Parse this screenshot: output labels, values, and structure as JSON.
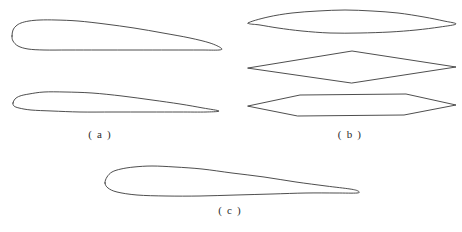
{
  "figure": {
    "background_color": "#ffffff",
    "stroke_color": "#3a3a3a",
    "stroke_width": 0.9,
    "width": 462,
    "height": 232,
    "labels": {
      "a": "( a )",
      "b": "( b )",
      "c": "( c )"
    }
  },
  "chart_data": {
    "type": "line",
    "title": "",
    "subtitle": "",
    "xlabel": "",
    "ylabel": "",
    "grid": false,
    "legend_position": "none",
    "groups": [
      {
        "key": "a",
        "label": "( a )",
        "label_x": 100,
        "label_y": 134,
        "shapes": [
          {
            "name": "thick-subsonic-airfoil",
            "kind": "rounded-airfoil",
            "chord_x0": 12,
            "chord_x1": 221,
            "leading_edge_y": 36,
            "trailing_edge_y": 50,
            "max_thickness": 30,
            "max_thickness_x_fraction": 0.14,
            "outline": [
              [
                12,
                36
              ],
              [
                13,
                30
              ],
              [
                16,
                26
              ],
              [
                21,
                23
              ],
              [
                29,
                21
              ],
              [
                40,
                20
              ],
              [
                56,
                20
              ],
              [
                78,
                21
              ],
              [
                105,
                24
              ],
              [
                134,
                28
              ],
              [
                163,
                33
              ],
              [
                190,
                38
              ],
              [
                210,
                43
              ],
              [
                221,
                48
              ],
              [
                219,
                50
              ],
              [
                200,
                50
              ],
              [
                170,
                50
              ],
              [
                135,
                50
              ],
              [
                100,
                50
              ],
              [
                68,
                50
              ],
              [
                44,
                50
              ],
              [
                28,
                49
              ],
              [
                18,
                46
              ],
              [
                13,
                41
              ],
              [
                12,
                36
              ]
            ]
          },
          {
            "name": "thin-subsonic-airfoil",
            "kind": "rounded-airfoil",
            "chord_x0": 13,
            "chord_x1": 219,
            "leading_edge_y": 103,
            "trailing_edge_y": 111,
            "max_thickness": 20,
            "max_thickness_x_fraction": 0.17,
            "outline": [
              [
                13,
                103
              ],
              [
                15,
                99
              ],
              [
                20,
                96
              ],
              [
                29,
                94
              ],
              [
                44,
                92
              ],
              [
                65,
                92
              ],
              [
                92,
                93
              ],
              [
                122,
                96
              ],
              [
                152,
                100
              ],
              [
                180,
                104
              ],
              [
                203,
                108
              ],
              [
                219,
                111
              ],
              [
                206,
                112
              ],
              [
                180,
                112
              ],
              [
                148,
                112
              ],
              [
                113,
                112
              ],
              [
                80,
                112
              ],
              [
                52,
                111
              ],
              [
                31,
                110
              ],
              [
                19,
                108
              ],
              [
                14,
                106
              ],
              [
                13,
                103
              ]
            ]
          }
        ]
      },
      {
        "key": "b",
        "label": "( b )",
        "label_x": 350,
        "label_y": 134,
        "shapes": [
          {
            "name": "biconvex-lens-airfoil",
            "kind": "biconvex",
            "chord_x0": 248,
            "chord_x1": 456,
            "centerline_y": 22,
            "max_thickness": 20,
            "outline": [
              [
                248,
                23
              ],
              [
                268,
                17
              ],
              [
                292,
                13
              ],
              [
                318,
                11
              ],
              [
                345,
                10
              ],
              [
                372,
                11
              ],
              [
                398,
                13
              ],
              [
                424,
                17
              ],
              [
                444,
                21
              ],
              [
                456,
                24
              ],
              [
                440,
                27
              ],
              [
                416,
                30
              ],
              [
                390,
                32
              ],
              [
                360,
                33
              ],
              [
                330,
                33
              ],
              [
                302,
                31
              ],
              [
                278,
                28
              ],
              [
                260,
                25
              ],
              [
                248,
                23
              ]
            ]
          },
          {
            "name": "double-wedge-diamond-airfoil",
            "kind": "double-wedge",
            "chord_x0": 248,
            "chord_x1": 456,
            "centerline_y": 67,
            "apex_x": 352,
            "max_thickness": 31,
            "outline": [
              [
                248,
                68
              ],
              [
                352,
                51
              ],
              [
                456,
                67
              ],
              [
                352,
                83
              ],
              [
                248,
                68
              ]
            ]
          },
          {
            "name": "hexagonal-airfoil",
            "kind": "hexagonal",
            "chord_x0": 248,
            "chord_x1": 456,
            "centerline_y": 105,
            "flat_x0": 300,
            "flat_x1": 406,
            "max_thickness": 22,
            "outline": [
              [
                248,
                106
              ],
              [
                300,
                95
              ],
              [
                406,
                94
              ],
              [
                456,
                105
              ],
              [
                404,
                115
              ],
              [
                298,
                116
              ],
              [
                248,
                106
              ]
            ]
          }
        ]
      },
      {
        "key": "c",
        "label": "( c )",
        "label_x": 230,
        "label_y": 210,
        "shapes": [
          {
            "name": "cambered-airfoil",
            "kind": "cambered-airfoil",
            "chord_x0": 105,
            "chord_x1": 358,
            "leading_edge_y": 183,
            "trailing_edge_y": 190,
            "max_thickness": 26,
            "max_thickness_x_fraction": 0.22,
            "outline": [
              [
                105,
                183
              ],
              [
                107,
                177
              ],
              [
                112,
                172
              ],
              [
                121,
                169
              ],
              [
                134,
                167
              ],
              [
                152,
                166
              ],
              [
                175,
                167
              ],
              [
                202,
                169
              ],
              [
                232,
                173
              ],
              [
                264,
                177
              ],
              [
                296,
                182
              ],
              [
                326,
                186
              ],
              [
                350,
                189
              ],
              [
                358,
                191
              ],
              [
                357,
                193
              ],
              [
                336,
                193
              ],
              [
                306,
                193
              ],
              [
                272,
                194
              ],
              [
                236,
                195
              ],
              [
                200,
                196
              ],
              [
                166,
                196
              ],
              [
                137,
                195
              ],
              [
                117,
                192
              ],
              [
                108,
                188
              ],
              [
                105,
                183
              ]
            ]
          }
        ]
      }
    ]
  }
}
